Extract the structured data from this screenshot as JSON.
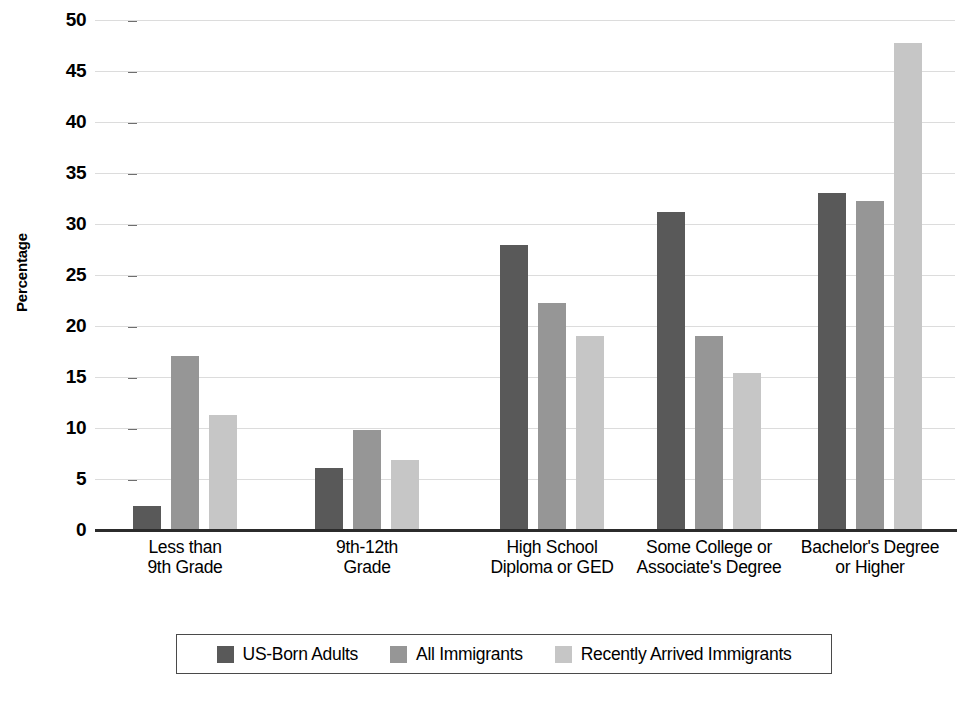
{
  "chart_data": {
    "type": "bar",
    "title": "",
    "xlabel": "",
    "ylabel": "Percentage",
    "ylim": [
      0,
      50
    ],
    "ytick_step": 5,
    "yticks": [
      50,
      45,
      40,
      35,
      30,
      25,
      20,
      15,
      10,
      5,
      0
    ],
    "grid": true,
    "legend_position": "bottom",
    "categories": [
      "Less than 9th Grade",
      "9th-12th Grade",
      "High School Diploma or GED",
      "Some College or Associate's Degree",
      "Bachelor's Degree or Higher"
    ],
    "category_lines": [
      [
        "Less than",
        "9th Grade"
      ],
      [
        "9th-12th",
        "Grade"
      ],
      [
        "High School",
        "Diploma or GED"
      ],
      [
        "Some College or",
        "Associate's Degree"
      ],
      [
        "Bachelor's Degree",
        "or Higher"
      ]
    ],
    "series": [
      {
        "name": "US-Born Adults",
        "color": "#595959",
        "values": [
          2.4,
          6.1,
          27.9,
          31.2,
          33.0
        ]
      },
      {
        "name": "All Immigrants",
        "color": "#969696",
        "values": [
          17.1,
          9.8,
          22.3,
          19.0,
          32.3
        ]
      },
      {
        "name": "Recently Arrived Immigrants",
        "color": "#c6c6c6",
        "values": [
          11.3,
          6.9,
          19.0,
          15.4,
          47.7
        ]
      }
    ]
  },
  "legend": {
    "items": [
      {
        "label": "US-Born Adults"
      },
      {
        "label": "All Immigrants"
      },
      {
        "label": "Recently Arrived Immigrants"
      }
    ]
  }
}
